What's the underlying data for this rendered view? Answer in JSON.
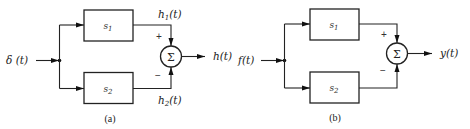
{
  "figure": {
    "panels": [
      {
        "id": "a",
        "caption": "(a)",
        "input": {
          "label": "δ (t)"
        },
        "blocks": [
          {
            "label": "s",
            "sub": "1"
          },
          {
            "label": "s",
            "sub": "2"
          }
        ],
        "branch_outputs": [
          {
            "label": "h",
            "sub": "1",
            "tail": "(t)"
          },
          {
            "label": "h",
            "sub": "2",
            "tail": "(t)"
          }
        ],
        "summer": {
          "symbol": "Σ",
          "top_sign": "+",
          "bottom_sign": "−"
        },
        "output": {
          "label": "h(t)"
        }
      },
      {
        "id": "b",
        "caption": "(b)",
        "input": {
          "label": "f(t)"
        },
        "blocks": [
          {
            "label": "s",
            "sub": "1"
          },
          {
            "label": "s",
            "sub": "2"
          }
        ],
        "summer": {
          "symbol": "Σ",
          "top_sign": "+",
          "bottom_sign": "−"
        },
        "output": {
          "label": "y(t)"
        }
      }
    ]
  }
}
